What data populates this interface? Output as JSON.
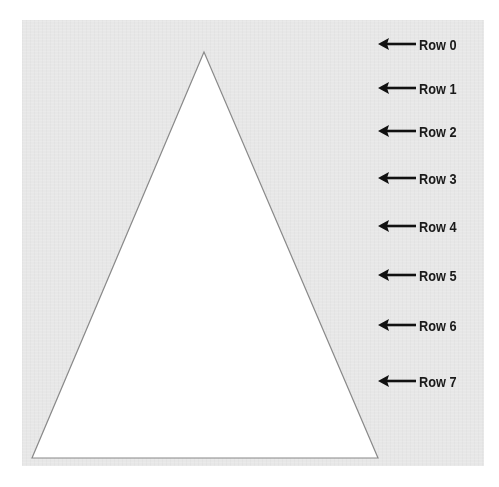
{
  "colors": {
    "panel_background": "#e7e7e7",
    "triangle_fill": "#ffffff",
    "triangle_stroke": "#8a8a8a",
    "number_light": "#b9b9b9",
    "number_dark": "#5f5f5f",
    "arrow_color": "#111111",
    "label_color": "#1a1a1a"
  },
  "rows": [
    {
      "label": "Row 0",
      "values": [
        "1"
      ]
    },
    {
      "label": "Row 1",
      "values": [
        "1",
        "1"
      ]
    },
    {
      "label": "Row 2",
      "values": [
        "1",
        "2",
        "1"
      ]
    },
    {
      "label": "Row 3",
      "values": [
        "1",
        "3",
        "3",
        "1"
      ]
    },
    {
      "label": "Row 4",
      "values": [
        "1",
        "4",
        "6",
        "4",
        "1"
      ]
    },
    {
      "label": "Row 5",
      "values": [
        "1",
        "5",
        "10",
        "10",
        "5",
        "1"
      ]
    },
    {
      "label": "Row 6",
      "values": [
        "1",
        "6",
        "15",
        "20",
        "15",
        "6",
        "1"
      ]
    },
    {
      "label": "Row 7",
      "values": [
        "1",
        "7",
        "21",
        "35",
        "35",
        "21",
        "7",
        "1"
      ]
    }
  ],
  "arrow_icon": "arrow-left-icon"
}
